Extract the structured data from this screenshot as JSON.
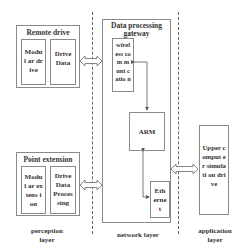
{
  "perception": {
    "remote_drive": {
      "title": "Remote drive",
      "modules": [
        "Modul ar drive",
        "Drive Data"
      ]
    },
    "point_extension": {
      "title": "Point extension",
      "modules": [
        "Modul ar extens ion",
        "Drive Data Proces sing"
      ]
    },
    "layer_label_line1": "perception",
    "layer_label_line2": "layer"
  },
  "network": {
    "gateway": {
      "title_line1": "Data processing",
      "title_line2": "gateway",
      "wireless": "wirel ess com muni catio n",
      "arm": "ARM",
      "ethernet": "Eth erne t"
    },
    "layer_label": "network layer"
  },
  "application": {
    "upper": "Upper comput er simulati on drive",
    "layer_label_line1": "application",
    "layer_label_line2": "layer"
  },
  "colors": {
    "border": "#8a8a8a",
    "dash": "#666666",
    "text": "#333333"
  }
}
